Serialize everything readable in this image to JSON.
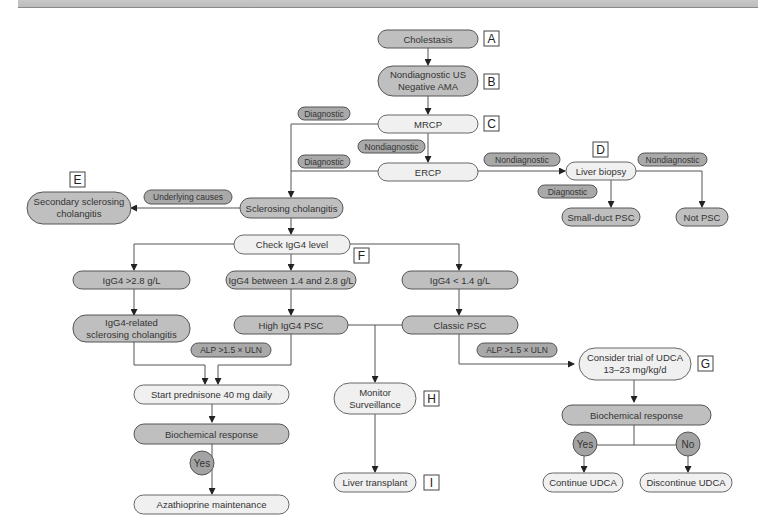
{
  "figure": {
    "type": "flowchart",
    "topic": "Diagnostic and management algorithm for cholestasis / sclerosing cholangitis"
  },
  "nodes": {
    "cholestasis": {
      "text": "Cholestasis",
      "label": "A"
    },
    "nondiagnostic_us": {
      "line1": "Nondiagnostic US",
      "line2": "Negative AMA",
      "label": "B"
    },
    "mrcp": {
      "text": "MRCP",
      "label": "C"
    },
    "ercp": {
      "text": "ERCP"
    },
    "liver_biopsy": {
      "text": "Liver biopsy",
      "label": "D"
    },
    "small_duct_psc": {
      "text": "Small-duct PSC"
    },
    "not_psc": {
      "text": "Not PSC"
    },
    "sclerosing_cholangitis": {
      "text": "Sclerosing cholangitis"
    },
    "secondary_sc": {
      "line1": "Secondary sclerosing",
      "line2": "cholangitis",
      "label": "E"
    },
    "check_igg4": {
      "text": "Check IgG4 level",
      "label": "F"
    },
    "igg4_high": {
      "text": "IgG4 >2.8 g/L"
    },
    "igg4_mid": {
      "text": "IgG4 between 1.4 and 2.8 g/L"
    },
    "igg4_low": {
      "text": "IgG4 < 1.4 g/L"
    },
    "igg4_related_sc": {
      "line1": "IgG4-related",
      "line2": "sclerosing cholangitis"
    },
    "high_igg4_psc": {
      "text": "High IgG4 PSC"
    },
    "classic_psc": {
      "text": "Classic PSC"
    },
    "start_prednisone": {
      "text": "Start prednisone 40 mg daily"
    },
    "biochem_response_left": {
      "text": "Biochemical response"
    },
    "azathioprine": {
      "text": "Azathioprine maintenance"
    },
    "monitor": {
      "line1": "Monitor",
      "line2": "Surveillance",
      "label": "H"
    },
    "liver_transplant": {
      "text": "Liver transplant",
      "label": "I"
    },
    "udca_trial": {
      "line1": "Consider trial of UDCA",
      "line2": "13–23 mg/kg/d",
      "label": "G"
    },
    "biochem_response_right": {
      "text": "Biochemical response"
    },
    "continue_udca": {
      "text": "Continue UDCA"
    },
    "discontinue_udca": {
      "text": "Discontinue UDCA"
    }
  },
  "edge_labels": {
    "mrcp_diagnostic": "Diagnostic",
    "mrcp_nondiagnostic": "Nondiagnostic",
    "ercp_diagnostic": "Diagnostic",
    "ercp_nondiagnostic": "Nondiagnostic",
    "biopsy_nondiagnostic": "Nondiagnostic",
    "biopsy_diagnostic": "Diagnostic",
    "underlying_causes": "Underlying causes",
    "alp_left": "ALP >1.5 × ULN",
    "alp_right": "ALP >1.5 × ULN",
    "yes_left": "Yes",
    "yes_right": "Yes",
    "no_right": "No"
  }
}
